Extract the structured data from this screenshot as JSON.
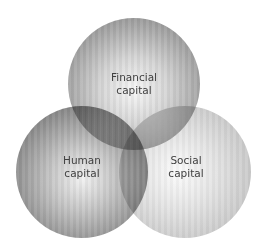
{
  "diagram": {
    "type": "venn",
    "sets": [
      {
        "id": "financial",
        "line1": "Financial",
        "line2": "capital",
        "cx": 134,
        "cy": 84,
        "r": 66
      },
      {
        "id": "human",
        "line1": "Human",
        "line2": "capital",
        "cx": 82,
        "cy": 172,
        "r": 66
      },
      {
        "id": "social",
        "line1": "Social",
        "line2": "capital",
        "cx": 185,
        "cy": 172,
        "r": 66
      }
    ],
    "colors": {
      "background": "#ffffff",
      "label_text": "#404040",
      "financial_rim": "#7c7c7c",
      "human_rim": "#6c6c6c",
      "social_rim": "#b4b4b4",
      "center_overlap": "#333333"
    }
  }
}
